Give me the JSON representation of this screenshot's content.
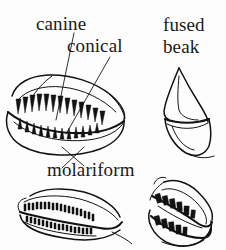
{
  "figure": {
    "type": "scientific-line-drawing-plate",
    "background_color": "#fdfdfd",
    "ink_color": "#121212",
    "panel_count": 4
  },
  "labels": {
    "canine": "canine",
    "conical": "conical",
    "fused_line1": "fused",
    "fused_line2": "beak",
    "molariform": "molariform"
  },
  "panels": [
    {
      "name": "canine-conical-jaw",
      "label": "canine",
      "secondary_label": "conical",
      "position": "top-left",
      "description": "open jaw in oblique view with two opposing rows of sharp triangular teeth",
      "tooth_shape": "pointed-triangular",
      "has_leader_lines": true,
      "leader_line_count": 2
    },
    {
      "name": "fused-beak",
      "label": "fused beak",
      "position": "top-right",
      "description": "pointed toothless beak profile with smooth curved outline",
      "tooth_shape": "none-fused",
      "has_leader_lines": false,
      "leader_line_count": 0
    },
    {
      "name": "molariform-jaw-left",
      "label": "molariform",
      "position": "bottom-left",
      "description": "narrow elongated jaw with dense rows of small low crowned teeth",
      "tooth_shape": "small-flat-crowned",
      "has_leader_lines": false,
      "leader_line_count": 0
    },
    {
      "name": "molariform-jaw-right",
      "label": "molariform",
      "position": "bottom-right",
      "description": "gaping jaw in oblique view with blocky rectangular flat crowned teeth",
      "tooth_shape": "blocky-rectangular",
      "has_leader_lines": false,
      "leader_line_count": 0
    }
  ]
}
